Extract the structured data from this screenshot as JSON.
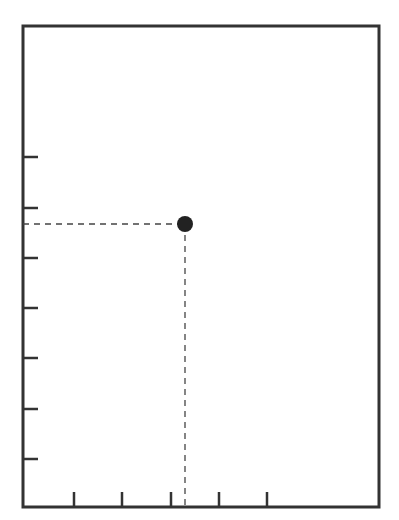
{
  "chart_data": {
    "type": "scatter",
    "title": "",
    "xlabel": "",
    "ylabel": "",
    "x_ticks": [
      1,
      2,
      3,
      4,
      5
    ],
    "y_ticks": [
      1,
      2,
      3,
      4,
      5,
      6,
      7
    ],
    "x_tick_labels": [],
    "y_tick_labels": [],
    "xlim": [
      0,
      7.3
    ],
    "ylim": [
      0,
      9.5
    ],
    "grid": false,
    "legend": null,
    "points": [
      {
        "x": 3.3,
        "y": 5.6,
        "guides": true
      }
    ]
  },
  "style": {
    "axis_color": "#333333",
    "point_color": "#222222",
    "guide_color": "#444444",
    "background": "#ffffff"
  },
  "layout": {
    "frame": {
      "left": 23,
      "top": 26,
      "right": 379,
      "bottom": 507
    },
    "x_tick_px": [
      74,
      122,
      171,
      219,
      267
    ],
    "y_tick_px": [
      459,
      409,
      358,
      308,
      258,
      208,
      157
    ],
    "point_px": {
      "cx": 185,
      "cy": 224,
      "r": 8
    }
  }
}
